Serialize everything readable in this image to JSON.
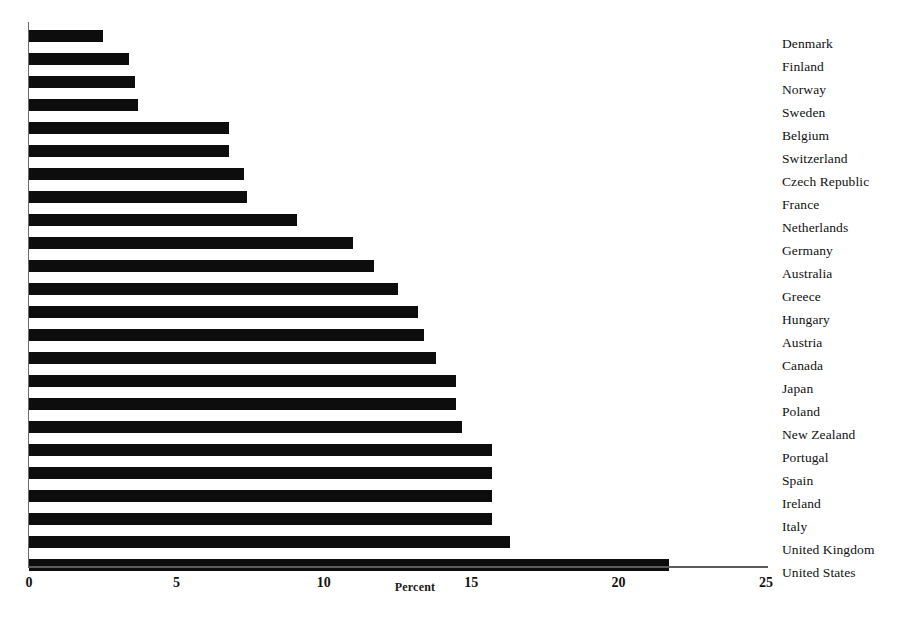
{
  "chart_data": {
    "type": "bar",
    "orientation": "horizontal",
    "title": "",
    "xlabel": "Percent",
    "ylabel": "",
    "xlim": [
      0,
      25
    ],
    "xticks": [
      0,
      5,
      10,
      15,
      20,
      25
    ],
    "xtick_labels": [
      "0",
      "5",
      "10",
      "15",
      "20",
      "25"
    ],
    "grid": false,
    "legend": false,
    "bar_color": "#0d0d0d",
    "categories": [
      "Denmark",
      "Finland",
      "Norway",
      "Sweden",
      "Belgium",
      "Switzerland",
      "Czech Republic",
      "France",
      "Netherlands",
      "Germany",
      "Australia",
      "Greece",
      "Hungary",
      "Austria",
      "Canada",
      "Japan",
      "Poland",
      "New Zealand",
      "Portugal",
      "Spain",
      "Ireland",
      "Italy",
      "United Kingdom",
      "United States"
    ],
    "values": [
      2.5,
      3.4,
      3.6,
      3.7,
      6.8,
      6.8,
      7.3,
      7.4,
      9.1,
      11.0,
      11.7,
      12.5,
      13.2,
      13.4,
      13.8,
      14.5,
      14.5,
      14.7,
      15.7,
      15.7,
      15.7,
      15.7,
      16.3,
      21.7
    ]
  },
  "axis": {
    "x_title": "Percent"
  }
}
